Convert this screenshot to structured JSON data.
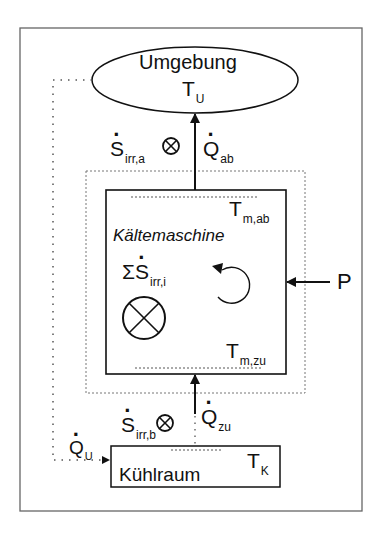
{
  "diagram": {
    "surroundings": {
      "name": "Umgebung",
      "temp_symbol": "T",
      "temp_sub": "U"
    },
    "machine": {
      "name": "Kältemaschine",
      "t_out_symbol": "T",
      "t_out_sub": "m,ab",
      "t_in_symbol": "T",
      "t_in_sub": "m,zu",
      "entropy_sum_prefix": "Σ",
      "entropy_symbol": "S",
      "entropy_sub": "irr,i",
      "cycle_icon": "circular-arrow-icon",
      "generation_icon": "circle-cross-icon"
    },
    "cold_room": {
      "name": "Kühlraum",
      "temp_symbol": "T",
      "temp_sub": "K"
    },
    "flows": {
      "heat_out": {
        "symbol": "Q",
        "sub": "ab"
      },
      "heat_in": {
        "symbol": "Q",
        "sub": "zu"
      },
      "heat_leak": {
        "symbol": "Q",
        "sub": "U"
      },
      "power": {
        "symbol": "P"
      },
      "entropy_a": {
        "symbol": "S",
        "sub": "irr,a"
      },
      "entropy_b": {
        "symbol": "S",
        "sub": "irr,b"
      }
    },
    "colors": {
      "line": "#111111",
      "frame": "#666666",
      "dotted": "#555555"
    }
  }
}
